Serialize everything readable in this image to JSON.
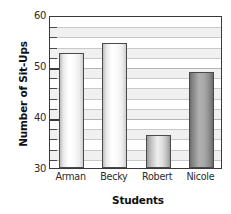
{
  "chart_data": {
    "type": "bar",
    "title": "",
    "xlabel": "Students",
    "ylabel": "Number of Sit-Ups",
    "categories": [
      "Arman",
      "Becky",
      "Robert",
      "Nicole"
    ],
    "values": [
      52.5,
      54.5,
      36.5,
      48.8
    ],
    "ylim": [
      30,
      60
    ],
    "ymajor_ticks": [
      30,
      40,
      50,
      60
    ],
    "ytick_labels": [
      "30",
      "40",
      "50",
      "60"
    ],
    "yminor_tick_interval": 2,
    "grid": true,
    "grid_orientation": "horizontal",
    "legend": false,
    "bar_styles": [
      "light",
      "light",
      "mid",
      "dark"
    ],
    "colors": {
      "bar_outline": "#4a4a4a",
      "axis": "#3a3a3a",
      "gridline": "#c9c9c9",
      "band": "#f2f2f2",
      "text": "#1a1a1a",
      "bar_light_fill": "#ffffff",
      "bar_mid_fill": "#ededed",
      "bar_dark_fill": "#a6a6a6"
    }
  }
}
